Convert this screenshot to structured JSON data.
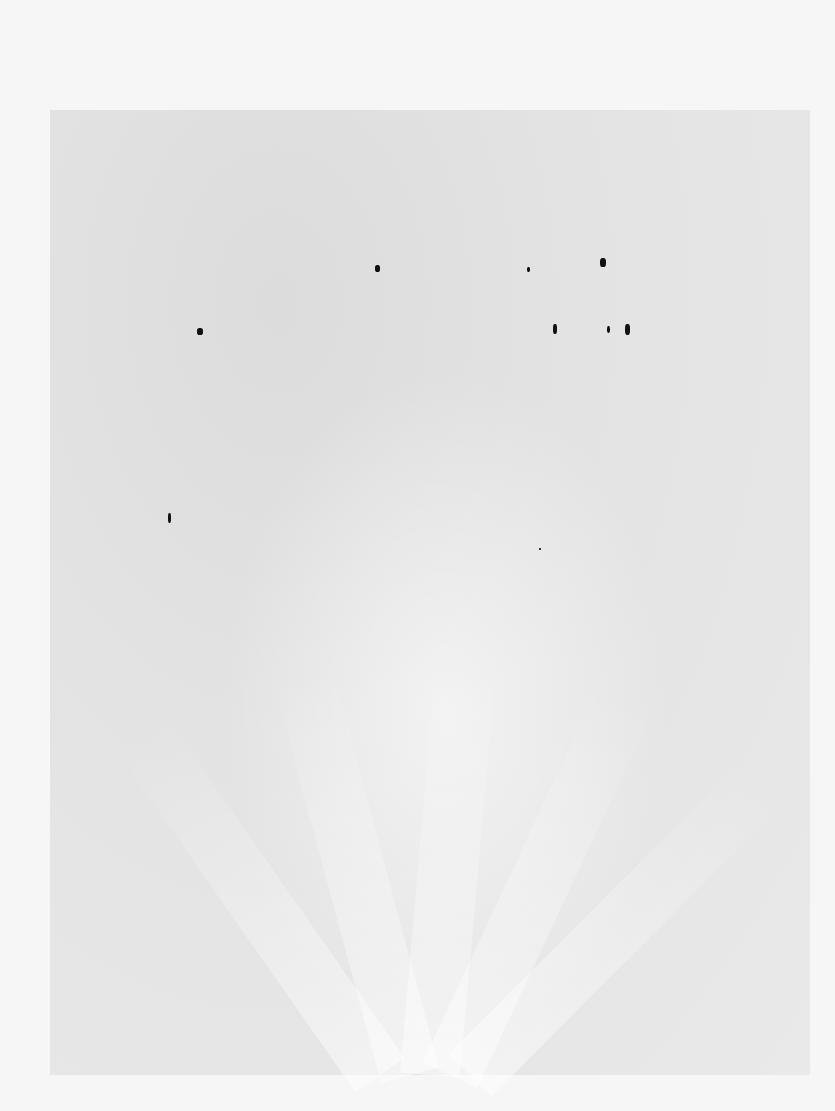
{
  "image": {
    "description": "Faint grayscale noisy scan with a slightly darker rectangular region and lighter radiating streaks toward the bottom; several small black ink specks scattered in the upper-middle area",
    "background_color": "#f6f6f6",
    "region_color": "#e4e4e4",
    "marks": [
      {
        "x": 375,
        "y": 265,
        "w": 5,
        "h": 7
      },
      {
        "x": 527,
        "y": 267,
        "w": 3,
        "h": 5
      },
      {
        "x": 600,
        "y": 258,
        "w": 6,
        "h": 9
      },
      {
        "x": 197,
        "y": 328,
        "w": 6,
        "h": 7
      },
      {
        "x": 553,
        "y": 324,
        "w": 4,
        "h": 10
      },
      {
        "x": 607,
        "y": 326,
        "w": 3,
        "h": 7
      },
      {
        "x": 625,
        "y": 324,
        "w": 5,
        "h": 11
      },
      {
        "x": 168,
        "y": 513,
        "w": 3,
        "h": 10
      },
      {
        "x": 539,
        "y": 548,
        "w": 2,
        "h": 2
      }
    ]
  }
}
